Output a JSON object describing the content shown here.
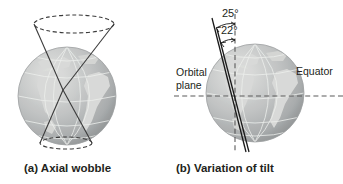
{
  "figure": {
    "background_color": "#ffffff",
    "ink_color": "#231f20",
    "panels": [
      {
        "id": "a",
        "caption": "(a) Axial wobble",
        "globe": {
          "name": "earth-globe",
          "ocean_color": "#b9bcbd",
          "land_color": "#d7d8d6",
          "graticule_color": "#e8e9e7",
          "center_x": 67,
          "center_y": 96,
          "radius": 49
        },
        "cones": {
          "upper": {
            "apex_x": 63,
            "apex_y": 90,
            "rim_center_x": 74,
            "rim_center_y": 24,
            "rim_rx": 40,
            "rim_ry": 9,
            "dashed": true
          },
          "lower": {
            "apex_x": 63,
            "apex_y": 90,
            "rim_center_x": 66,
            "rim_center_y": 143,
            "rim_rx": 26,
            "rim_ry": 6,
            "dashed": true
          }
        }
      },
      {
        "id": "b",
        "caption": "(b) Variation of tilt",
        "globe": {
          "name": "earth-globe",
          "ocean_color": "#b9bcbd",
          "land_color": "#d7d8d6",
          "graticule_color": "#e8e9e7",
          "center_x": 255,
          "center_y": 93,
          "radius": 49
        },
        "labels": {
          "orbital_plane_line1": "Orbital",
          "orbital_plane_line2": "plane",
          "equator": "Equator"
        },
        "angles": [
          {
            "name": "tilt-max",
            "value": "25°",
            "degrees": 25
          },
          {
            "name": "tilt-min",
            "value": "22°",
            "degrees": 22
          }
        ],
        "reference_lines": {
          "vertical_dashed": "perpendicular-to-orbital-plane",
          "horizontal_dashed": "orbital-plane-equator-line"
        }
      }
    ]
  }
}
